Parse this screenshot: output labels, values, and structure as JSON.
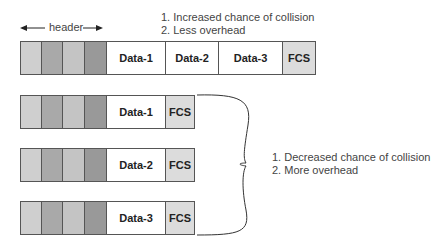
{
  "header_label": "header",
  "top_notes": [
    "1.  Increased chance of collision",
    "2.  Less overhead"
  ],
  "side_notes": [
    "1.  Decreased chance of collision",
    "2.  More overhead"
  ],
  "top_frame": {
    "data": [
      "Data-1",
      "Data-2",
      "Data-3"
    ],
    "fcs": "FCS"
  },
  "split_frames": [
    {
      "data": "Data-1",
      "fcs": "FCS"
    },
    {
      "data": "Data-2",
      "fcs": "FCS"
    },
    {
      "data": "Data-3",
      "fcs": "FCS"
    }
  ],
  "colors": {
    "header_light": "#cfcfcf",
    "header_dark": "#999999",
    "fcs": "#dcdcdc",
    "border": "#555555"
  }
}
